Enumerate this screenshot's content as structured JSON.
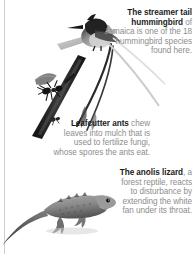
{
  "page": {
    "background": "#ffffff",
    "rule_color": "#cfcfcf",
    "lead_color": "#1b1b1b",
    "body_color": "#8d8d8d",
    "width": 196,
    "height": 254
  },
  "captions": [
    {
      "id": "hummingbird",
      "lead": "The streamer tail hummingbird",
      "body": " of Jamaica is one of the 18 hummingbird species found here.",
      "align": "right"
    },
    {
      "id": "ants",
      "lead": "Leafcutter ants",
      "body": " chew leaves into mulch that is used to fertilize fungi, whose spores the ants eat.",
      "align": "right"
    },
    {
      "id": "lizard",
      "lead": "The anolis lizard",
      "body": ", a forest reptile, reacts to disturbance by extending the white fan under its throat.",
      "align": "right"
    }
  ],
  "artwork": [
    {
      "id": "hummingbird",
      "name": "streamer-tail-hummingbird-photo",
      "description": "Perched hummingbird with two long streamer tail feathers trailing down and left"
    },
    {
      "id": "ant-twig",
      "name": "leafcutter-ant-on-twig-photo",
      "description": "Dark diagonal twig with a leafcutter ant carrying a leaf fragment"
    },
    {
      "id": "lizard",
      "name": "anolis-lizard-photo",
      "description": "Grey lizard on a branch with a long tail extending to the left"
    }
  ]
}
